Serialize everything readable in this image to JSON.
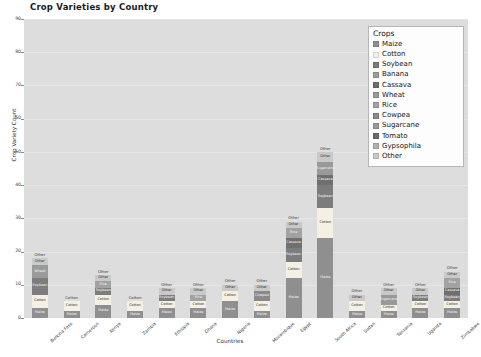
{
  "chart_data": {
    "type": "bar",
    "title": "Crop Varieties by Country",
    "xlabel": "Countries",
    "ylabel": "Crop Variety Count",
    "ylim": [
      0,
      90
    ],
    "yticks": [
      0,
      10,
      20,
      30,
      40,
      50,
      60,
      70,
      80,
      90
    ],
    "grid": true,
    "stacked": true,
    "legend_title": "Crops",
    "legend_position": "upper right",
    "categories": [
      "Burkina Faso",
      "Cameroon",
      "Kenya",
      "Zambia",
      "Ethiopia",
      "Ghana",
      "Nigeria",
      "Mozambique",
      "Egypt",
      "South Africa",
      "Sudan",
      "Tanzania",
      "Uganda",
      "Zimbabwe"
    ],
    "series": [
      {
        "name": "Maize",
        "color": "#8f8f8f",
        "values": [
          3,
          2,
          4,
          2,
          3,
          3,
          5,
          2,
          12,
          24,
          2,
          2,
          3,
          3
        ]
      },
      {
        "name": "Cotton",
        "color": "#f4f1e4",
        "values": [
          4,
          3,
          3,
          3,
          2,
          2,
          3,
          3,
          5,
          9,
          3,
          2,
          2,
          2
        ]
      },
      {
        "name": "Soybean",
        "color": "#7c7c7c",
        "values": [
          5,
          0,
          2,
          0,
          2,
          0,
          0,
          0,
          4,
          7,
          0,
          0,
          2,
          2
        ]
      },
      {
        "name": "Banana",
        "color": "#9b9b9b",
        "values": [
          0,
          0,
          0,
          0,
          0,
          0,
          0,
          0,
          0,
          0,
          0,
          0,
          0,
          0
        ]
      },
      {
        "name": "Cassava",
        "color": "#6f6f6f",
        "values": [
          0,
          0,
          0,
          0,
          0,
          0,
          0,
          0,
          3,
          3,
          0,
          0,
          0,
          2
        ]
      },
      {
        "name": "Wheat",
        "color": "#9a9a9a",
        "values": [
          4,
          0,
          0,
          0,
          0,
          0,
          0,
          0,
          0,
          0,
          0,
          0,
          0,
          0
        ]
      },
      {
        "name": "Rice",
        "color": "#a2a2a2",
        "values": [
          0,
          0,
          2,
          0,
          0,
          2,
          0,
          0,
          3,
          0,
          0,
          0,
          0,
          3
        ]
      },
      {
        "name": "Cowpea",
        "color": "#8a8a8a",
        "values": [
          0,
          0,
          0,
          0,
          0,
          0,
          0,
          3,
          0,
          0,
          0,
          0,
          0,
          0
        ]
      },
      {
        "name": "Sugarcane",
        "color": "#999999",
        "values": [
          0,
          0,
          0,
          0,
          0,
          0,
          0,
          0,
          0,
          4,
          0,
          3,
          0,
          0
        ]
      },
      {
        "name": "Tomato",
        "color": "#6a6a6a",
        "values": [
          0,
          0,
          0,
          0,
          0,
          0,
          0,
          0,
          0,
          0,
          0,
          0,
          0,
          0
        ]
      },
      {
        "name": "Gypsophila",
        "color": "#b0b0b0",
        "values": [
          0,
          0,
          0,
          0,
          0,
          0,
          0,
          0,
          0,
          0,
          0,
          0,
          0,
          0
        ]
      },
      {
        "name": "Other",
        "color": "#c9c9c9",
        "values": [
          2,
          0,
          2,
          0,
          2,
          2,
          2,
          2,
          2,
          3,
          2,
          2,
          2,
          2
        ]
      }
    ],
    "totals": [
      18,
      5,
      13,
      5,
      9,
      9,
      10,
      10,
      29,
      50,
      7,
      9,
      9,
      14
    ]
  },
  "legend": {
    "title": "Crops",
    "items": [
      {
        "label": "Maize"
      },
      {
        "label": "Cotton"
      },
      {
        "label": "Soybean"
      },
      {
        "label": "Banana"
      },
      {
        "label": "Cassava"
      },
      {
        "label": "Wheat"
      },
      {
        "label": "Rice"
      },
      {
        "label": "Cowpea"
      },
      {
        "label": "Sugarcane"
      },
      {
        "label": "Tomato"
      },
      {
        "label": "Gypsophila"
      },
      {
        "label": "Other"
      }
    ]
  },
  "colors": {
    "plot_background": "#dddddd",
    "figure_background": "#ffffff",
    "gridline": "#e6e6e6",
    "text": "#2b2b2b"
  }
}
